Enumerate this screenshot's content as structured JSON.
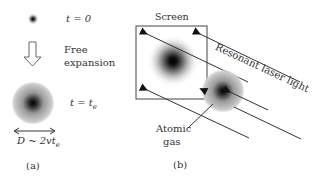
{
  "panel_a": {
    "initial_label": "t = 0",
    "arrow_label_line1": "Free",
    "arrow_label_line2": "expansion",
    "final_label": "t = t",
    "final_label_sub": "e",
    "diameter_label": "D ~ 2vt",
    "diameter_label_sub": "e",
    "caption": "(a)"
  },
  "panel_b": {
    "screen_label": "Screen",
    "laser_label": "Resonant laser light",
    "gas_label_line1": "Atomic",
    "gas_label_line2": "gas",
    "caption": "(b)"
  },
  "colors": {
    "line": "#333333",
    "cloud_core": "#000000"
  }
}
